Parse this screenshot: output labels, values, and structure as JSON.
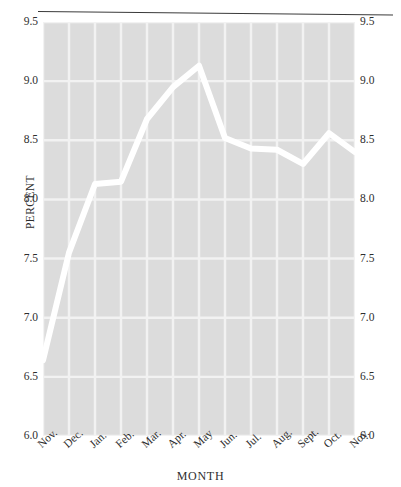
{
  "chart_data": {
    "type": "line",
    "title": "",
    "xlabel": "MONTH",
    "ylabel": "PERCENT",
    "categories": [
      "Nov.",
      "Dec.",
      "Jan.",
      "Feb.",
      "Mar.",
      "Apr.",
      "May",
      "Jun.",
      "Jul.",
      "Aug.",
      "Sept.",
      "Oct.",
      "Nov."
    ],
    "values": [
      6.64,
      7.55,
      8.13,
      8.15,
      8.68,
      8.95,
      9.13,
      8.52,
      8.43,
      8.42,
      8.3,
      8.56,
      8.4
    ],
    "series": [
      {
        "name": "percent",
        "values": [
          6.64,
          7.55,
          8.13,
          8.15,
          8.68,
          8.95,
          9.13,
          8.52,
          8.43,
          8.42,
          8.3,
          8.56,
          8.4
        ]
      }
    ],
    "ylim": [
      6.0,
      9.5
    ],
    "ytick_values": [
      6.0,
      6.5,
      7.0,
      7.5,
      8.0,
      8.5,
      9.0,
      9.5
    ],
    "ytick_labels_left": [
      "6.0",
      "6.5",
      "7.0",
      "7.5",
      "8.0",
      "8.5",
      "9.0",
      "9.5"
    ],
    "ytick_labels_right": [
      "6.0",
      "6.5",
      "7.0",
      "7.5",
      "8.0",
      "8.5",
      "9.0",
      "9.5"
    ],
    "xtick_labels": [
      "Nov.",
      "Dec.",
      "Jan.",
      "Feb.",
      "Mar.",
      "Apr.",
      "May",
      "Jun.",
      "Jul.",
      "Aug.",
      "Sept.",
      "Oct.",
      "Nov."
    ],
    "grid": true,
    "legend": null,
    "line_color": "#ffffff",
    "plot_background": "#dcdcdc",
    "grid_color": "#f2f2f2",
    "page_background": "#ffffff",
    "text_color": "#2e2e2e"
  },
  "axes": {
    "y_title": "PERCENT",
    "x_title": "MONTH"
  }
}
